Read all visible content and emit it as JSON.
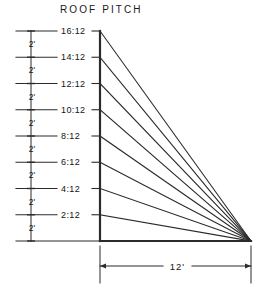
{
  "drawing": {
    "title": "ROOF PITCH",
    "units": "feet",
    "run_label": "12'",
    "rise_increment_label": "2'",
    "pitch_labels": [
      "16:12",
      "14:12",
      "12:12",
      "10:12",
      "8:12",
      "6:12",
      "4:12",
      "2:12"
    ],
    "baseline_label": "",
    "colors": {
      "ink": "#1a1a1a",
      "line": "#2b2b2b",
      "background": "#ffffff"
    }
  },
  "chart_data": {
    "type": "line",
    "title": "ROOF PITCH",
    "xlabel": "",
    "ylabel": "",
    "run_feet": 12,
    "rise_step_feet": 2,
    "xlim": [
      0,
      12
    ],
    "ylim": [
      0,
      16
    ],
    "grid": false,
    "legend_position": "left-labels",
    "apex_point": {
      "x": 12,
      "y": 0
    },
    "series": [
      {
        "name": "16:12",
        "rise_feet": 16,
        "run_feet": 12,
        "slope_ratio": 1.3333,
        "points": [
          [
            0,
            16
          ],
          [
            12,
            0
          ]
        ]
      },
      {
        "name": "14:12",
        "rise_feet": 14,
        "run_feet": 12,
        "slope_ratio": 1.1667,
        "points": [
          [
            0,
            14
          ],
          [
            12,
            0
          ]
        ]
      },
      {
        "name": "12:12",
        "rise_feet": 12,
        "run_feet": 12,
        "slope_ratio": 1.0,
        "points": [
          [
            0,
            12
          ],
          [
            12,
            0
          ]
        ]
      },
      {
        "name": "10:12",
        "rise_feet": 10,
        "run_feet": 12,
        "slope_ratio": 0.8333,
        "points": [
          [
            0,
            10
          ],
          [
            12,
            0
          ]
        ]
      },
      {
        "name": "8:12",
        "rise_feet": 8,
        "run_feet": 12,
        "slope_ratio": 0.6667,
        "points": [
          [
            0,
            8
          ],
          [
            12,
            0
          ]
        ]
      },
      {
        "name": "6:12",
        "rise_feet": 6,
        "run_feet": 12,
        "slope_ratio": 0.5,
        "points": [
          [
            0,
            6
          ],
          [
            12,
            0
          ]
        ]
      },
      {
        "name": "4:12",
        "rise_feet": 4,
        "run_feet": 12,
        "slope_ratio": 0.3333,
        "points": [
          [
            0,
            4
          ],
          [
            12,
            0
          ]
        ]
      },
      {
        "name": "2:12",
        "rise_feet": 2,
        "run_feet": 12,
        "slope_ratio": 0.1667,
        "points": [
          [
            0,
            2
          ],
          [
            12,
            0
          ]
        ]
      }
    ],
    "vertical_dimension_chain": [
      {
        "label": "2'",
        "from_feet": 14,
        "to_feet": 16
      },
      {
        "label": "2'",
        "from_feet": 12,
        "to_feet": 14
      },
      {
        "label": "2'",
        "from_feet": 10,
        "to_feet": 12
      },
      {
        "label": "2'",
        "from_feet": 8,
        "to_feet": 10
      },
      {
        "label": "2'",
        "from_feet": 6,
        "to_feet": 8
      },
      {
        "label": "2'",
        "from_feet": 4,
        "to_feet": 6
      },
      {
        "label": "2'",
        "from_feet": 2,
        "to_feet": 4
      },
      {
        "label": "2'",
        "from_feet": 0,
        "to_feet": 2
      }
    ],
    "horizontal_dimension": {
      "label": "12'",
      "from_feet": 0,
      "to_feet": 12
    }
  }
}
